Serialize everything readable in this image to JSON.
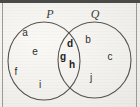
{
  "figure": {
    "kind": "venn-diagram-two-sets",
    "background_color": "#f2f1ee",
    "stroke_color": "#55545200",
    "border_top_color": "#4a4a48",
    "border_side_color": "#9b9a96"
  },
  "sets": [
    {
      "id": "P",
      "label": "P",
      "label_x": 50,
      "label_y": 14,
      "circle": {
        "cx": 44,
        "cy": 61,
        "rx": 36,
        "ry": 39
      }
    },
    {
      "id": "Q",
      "label": "Q",
      "label_x": 95,
      "label_y": 14,
      "circle": {
        "cx": 94.5,
        "cy": 60,
        "rx": 36.5,
        "ry": 38
      }
    }
  ],
  "regions": {
    "p_only": {
      "name": "P only",
      "elements": [
        {
          "text": "a",
          "x": 25,
          "y": 33,
          "bold": false
        },
        {
          "text": "e",
          "x": 35,
          "y": 52,
          "bold": false
        },
        {
          "text": "f",
          "x": 16,
          "y": 72,
          "bold": false
        },
        {
          "text": "i",
          "x": 40,
          "y": 85,
          "bold": false
        }
      ]
    },
    "intersection": {
      "name": "P and Q",
      "elements": [
        {
          "text": "d",
          "x": 70,
          "y": 44,
          "bold": true
        },
        {
          "text": "g",
          "x": 63,
          "y": 57,
          "bold": true
        },
        {
          "text": "h",
          "x": 72,
          "y": 65,
          "bold": true
        }
      ]
    },
    "q_only": {
      "name": "Q only",
      "elements": [
        {
          "text": "b",
          "x": 88,
          "y": 40,
          "bold": false
        },
        {
          "text": "c",
          "x": 110,
          "y": 57,
          "bold": false
        },
        {
          "text": "j",
          "x": 91,
          "y": 78,
          "bold": false
        }
      ]
    }
  }
}
